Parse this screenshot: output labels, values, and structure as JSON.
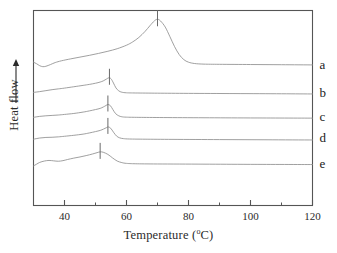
{
  "figure": {
    "kind": "dsc-thermogram",
    "background_color": "#ffffff",
    "frame_color": "#555555",
    "curve_color": "#8f8f8f",
    "marker_color": "#6a6a6a",
    "text_color": "#2b2b2b"
  },
  "axes": {
    "x_title_prefix": "Temperature (",
    "x_title_degree": "o",
    "x_title_suffix": "C)",
    "x_title_full": "Temperature (°C)",
    "y_title": "Heat flow",
    "y_arrow_icon": "up-arrow-icon",
    "x_tick_labels": [
      "40",
      "60",
      "80",
      "100",
      "120"
    ],
    "x_tick_values": [
      40,
      60,
      80,
      100,
      120
    ],
    "x_minor_tick_values": [
      50,
      70,
      90,
      110
    ],
    "y_tick_labels": []
  },
  "curve_labels": [
    {
      "id": "a",
      "label": "a"
    },
    {
      "id": "b",
      "label": "b"
    },
    {
      "id": "c",
      "label": "c"
    },
    {
      "id": "d",
      "label": "d"
    },
    {
      "id": "e",
      "label": "e"
    }
  ],
  "chart_data": {
    "type": "line",
    "title": "",
    "subtitle": "",
    "xlabel": "Temperature (°C)",
    "ylabel": "Heat flow",
    "xlim": [
      30,
      120
    ],
    "ylim": [
      0,
      1
    ],
    "grid": false,
    "legend": "right-inline-labels",
    "y_axis_ticks": false,
    "y_units": "arbitrary (offset curves)",
    "annotations": [
      {
        "text": "a",
        "x": 121,
        "y_note": "right of curve a baseline"
      },
      {
        "text": "b",
        "x": 121,
        "y_note": "right of curve b baseline"
      },
      {
        "text": "c",
        "x": 121,
        "y_note": "right of curve c baseline"
      },
      {
        "text": "d",
        "x": 121,
        "y_note": "right of curve d baseline"
      },
      {
        "text": "e",
        "x": 121,
        "y_note": "right of curve e baseline"
      }
    ],
    "peak_markers": [
      {
        "series": "a",
        "x": 70.0
      },
      {
        "series": "b",
        "x": 54.5
      },
      {
        "series": "c",
        "x": 54.0
      },
      {
        "series": "d",
        "x": 54.0
      },
      {
        "series": "e",
        "x": 51.5
      }
    ],
    "series": [
      {
        "name": "a",
        "peak_temperature": 70.0,
        "baseline_offset": 0.72,
        "points": [
          [
            30.0,
            0.735
          ],
          [
            31.0,
            0.727
          ],
          [
            32.0,
            0.717
          ],
          [
            33.0,
            0.712
          ],
          [
            34.0,
            0.714
          ],
          [
            35.5,
            0.723
          ],
          [
            37.0,
            0.733
          ],
          [
            39.0,
            0.742
          ],
          [
            42.0,
            0.752
          ],
          [
            45.0,
            0.761
          ],
          [
            48.0,
            0.77
          ],
          [
            51.0,
            0.78
          ],
          [
            54.0,
            0.791
          ],
          [
            57.0,
            0.804
          ],
          [
            60.0,
            0.822
          ],
          [
            62.0,
            0.839
          ],
          [
            64.0,
            0.862
          ],
          [
            66.0,
            0.893
          ],
          [
            67.5,
            0.921
          ],
          [
            69.0,
            0.947
          ],
          [
            70.0,
            0.955
          ],
          [
            71.0,
            0.946
          ],
          [
            72.5,
            0.915
          ],
          [
            74.0,
            0.866
          ],
          [
            75.5,
            0.815
          ],
          [
            77.0,
            0.774
          ],
          [
            78.5,
            0.748
          ],
          [
            80.0,
            0.735
          ],
          [
            82.0,
            0.728
          ],
          [
            85.0,
            0.725
          ],
          [
            90.0,
            0.724
          ],
          [
            100.0,
            0.723
          ],
          [
            110.0,
            0.722
          ],
          [
            120.0,
            0.721
          ]
        ]
      },
      {
        "name": "b",
        "peak_temperature": 54.5,
        "baseline_offset": 0.575,
        "points": [
          [
            30.0,
            0.58
          ],
          [
            32.0,
            0.584
          ],
          [
            34.0,
            0.589
          ],
          [
            36.0,
            0.594
          ],
          [
            38.0,
            0.598
          ],
          [
            40.0,
            0.602
          ],
          [
            43.0,
            0.609
          ],
          [
            46.0,
            0.616
          ],
          [
            48.0,
            0.621
          ],
          [
            50.0,
            0.627
          ],
          [
            51.5,
            0.633
          ],
          [
            52.5,
            0.639
          ],
          [
            53.5,
            0.648
          ],
          [
            54.3,
            0.655
          ],
          [
            55.0,
            0.65
          ],
          [
            55.8,
            0.628
          ],
          [
            56.6,
            0.603
          ],
          [
            57.5,
            0.588
          ],
          [
            58.5,
            0.581
          ],
          [
            60.0,
            0.578
          ],
          [
            63.0,
            0.577
          ],
          [
            70.0,
            0.576
          ],
          [
            80.0,
            0.575
          ],
          [
            95.0,
            0.574
          ],
          [
            110.0,
            0.573
          ],
          [
            120.0,
            0.572
          ]
        ]
      },
      {
        "name": "c",
        "peak_temperature": 54.0,
        "baseline_offset": 0.455,
        "points": [
          [
            30.0,
            0.452
          ],
          [
            32.0,
            0.457
          ],
          [
            34.0,
            0.46
          ],
          [
            36.0,
            0.462
          ],
          [
            38.0,
            0.464
          ],
          [
            40.0,
            0.467
          ],
          [
            43.0,
            0.472
          ],
          [
            46.0,
            0.479
          ],
          [
            48.0,
            0.485
          ],
          [
            50.0,
            0.492
          ],
          [
            51.5,
            0.498
          ],
          [
            52.5,
            0.505
          ],
          [
            53.4,
            0.513
          ],
          [
            54.0,
            0.518
          ],
          [
            54.8,
            0.512
          ],
          [
            55.6,
            0.492
          ],
          [
            56.5,
            0.471
          ],
          [
            57.5,
            0.46
          ],
          [
            58.5,
            0.455
          ],
          [
            60.0,
            0.453
          ],
          [
            64.0,
            0.452
          ],
          [
            72.0,
            0.451
          ],
          [
            85.0,
            0.45
          ],
          [
            100.0,
            0.449
          ],
          [
            120.0,
            0.448
          ]
        ]
      },
      {
        "name": "d",
        "peak_temperature": 54.0,
        "baseline_offset": 0.345,
        "points": [
          [
            30.0,
            0.34
          ],
          [
            32.0,
            0.346
          ],
          [
            34.0,
            0.349
          ],
          [
            36.0,
            0.35
          ],
          [
            38.0,
            0.352
          ],
          [
            40.0,
            0.355
          ],
          [
            43.0,
            0.36
          ],
          [
            46.0,
            0.366
          ],
          [
            48.0,
            0.372
          ],
          [
            50.0,
            0.379
          ],
          [
            51.5,
            0.385
          ],
          [
            52.6,
            0.392
          ],
          [
            53.5,
            0.399
          ],
          [
            54.1,
            0.403
          ],
          [
            54.9,
            0.396
          ],
          [
            55.8,
            0.376
          ],
          [
            56.8,
            0.356
          ],
          [
            57.8,
            0.347
          ],
          [
            59.0,
            0.343
          ],
          [
            61.0,
            0.341
          ],
          [
            66.0,
            0.34
          ],
          [
            75.0,
            0.339
          ],
          [
            90.0,
            0.338
          ],
          [
            105.0,
            0.337
          ],
          [
            120.0,
            0.336
          ]
        ]
      },
      {
        "name": "e",
        "peak_temperature": 51.5,
        "baseline_offset": 0.215,
        "points": [
          [
            30.0,
            0.203
          ],
          [
            31.0,
            0.212
          ],
          [
            32.0,
            0.221
          ],
          [
            33.5,
            0.228
          ],
          [
            35.0,
            0.231
          ],
          [
            36.5,
            0.229
          ],
          [
            38.0,
            0.227
          ],
          [
            39.5,
            0.23
          ],
          [
            41.0,
            0.236
          ],
          [
            43.0,
            0.243
          ],
          [
            45.0,
            0.249
          ],
          [
            47.0,
            0.256
          ],
          [
            49.0,
            0.264
          ],
          [
            50.5,
            0.271
          ],
          [
            51.5,
            0.275
          ],
          [
            52.5,
            0.273
          ],
          [
            54.0,
            0.262
          ],
          [
            55.5,
            0.244
          ],
          [
            57.0,
            0.228
          ],
          [
            58.5,
            0.22
          ],
          [
            60.0,
            0.216
          ],
          [
            63.0,
            0.214
          ],
          [
            70.0,
            0.213
          ],
          [
            85.0,
            0.212
          ],
          [
            100.0,
            0.211
          ],
          [
            120.0,
            0.21
          ]
        ]
      }
    ]
  }
}
